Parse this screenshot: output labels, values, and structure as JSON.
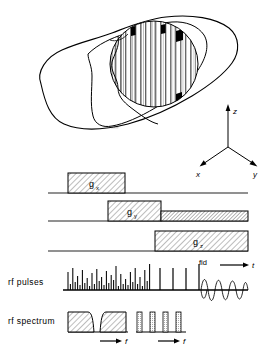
{
  "figure": {
    "type": "nmr-imaging-pulse-sequence-diagram",
    "background": "#ffffff",
    "ink": "#000000",
    "hatch_fill": "#e8e8e8"
  },
  "anatomy": {
    "name": "head-outline-with-slice-columns",
    "description": "Sagittal/oblique head outline with a circular imaging region subdivided into vertical slice columns; several columns shaded black at their tops.",
    "slice_columns": 18,
    "black_marker_columns": [
      4,
      9,
      13,
      17
    ]
  },
  "axes_triad": {
    "name": "coordinate-axes",
    "z_label": "z",
    "x_label": "x",
    "y_label": "y"
  },
  "gradients": [
    {
      "id": "gx",
      "label": "g",
      "subscript": "x",
      "baseline_label": "",
      "segments": [
        {
          "start_pct": 26,
          "end_pct": 56,
          "height": 20
        }
      ]
    },
    {
      "id": "gy",
      "label": "g",
      "subscript": "y",
      "baseline_label": "",
      "segments": [
        {
          "start_pct": 48,
          "end_pct": 71,
          "height": 20
        },
        {
          "start_pct": 71,
          "end_pct": 100,
          "height": 10
        }
      ]
    },
    {
      "id": "gz",
      "label": "g",
      "subscript": "z",
      "baseline_label": "",
      "segments": [
        {
          "start_pct": 68,
          "end_pct": 100,
          "height": 20
        }
      ]
    }
  ],
  "rf_pulses": {
    "row_label": "rf pulses",
    "fid_label": "fid",
    "time_axis_label": "t",
    "comb_note": "dense irregular pulse comb followed by four isolated tall pulses",
    "pulse_heights": [
      18,
      6,
      22,
      8,
      14,
      5,
      20,
      7,
      12,
      4,
      17,
      6,
      21,
      9,
      13,
      5,
      19,
      7,
      15,
      10,
      24,
      4,
      16,
      6,
      11,
      5,
      18,
      8,
      22,
      6,
      13,
      4,
      20,
      9,
      26
    ],
    "isolated_pulses": [
      {
        "pos_pct": 47,
        "height": 22
      },
      {
        "pos_pct": 56,
        "height": 22
      },
      {
        "pos_pct": 65,
        "height": 22
      },
      {
        "pos_pct": 74,
        "height": 26
      }
    ],
    "fid": {
      "cycles": 10,
      "start_pct": 75,
      "end_pct": 100,
      "description": "oscillating free induction decay, slowly damped sinusoid"
    }
  },
  "rf_spectrum": {
    "row_label": "rf spectrum",
    "frequency_axis_label_left": "f",
    "frequency_axis_label_right": "f",
    "blocks": [
      {
        "start_pct": 0,
        "end_pct": 19,
        "height": 20,
        "shape": "flat-top-with-notch-right"
      },
      {
        "start_pct": 22,
        "end_pct": 39,
        "height": 20,
        "shape": "flat-top-with-notch-left"
      }
    ],
    "combs": [
      {
        "pos_pct": 50,
        "height": 20
      },
      {
        "pos_pct": 60,
        "height": 20
      },
      {
        "pos_pct": 70,
        "height": 20
      },
      {
        "pos_pct": 80,
        "height": 20
      }
    ]
  }
}
